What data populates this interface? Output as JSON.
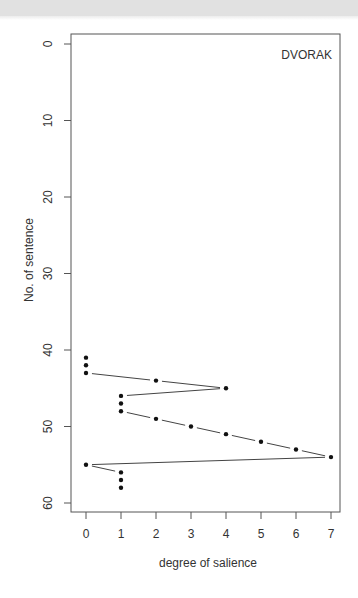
{
  "chart_data": {
    "type": "line",
    "title": "DVORAK",
    "xlabel": "degree of salience",
    "ylabel": "No. of sentence",
    "xlim": [
      0,
      7
    ],
    "ylim": [
      60,
      0
    ],
    "y_inverted": true,
    "grid": false,
    "legend": null,
    "x_ticks": [
      0,
      1,
      2,
      3,
      4,
      5,
      6,
      7
    ],
    "y_ticks": [
      0,
      10,
      20,
      30,
      40,
      50,
      60
    ],
    "style": "points connected by lines with gaps (type b)",
    "points": [
      {
        "sentence": 41,
        "salience": 0
      },
      {
        "sentence": 42,
        "salience": 0
      },
      {
        "sentence": 43,
        "salience": 0
      },
      {
        "sentence": 44,
        "salience": 2
      },
      {
        "sentence": 45,
        "salience": 4
      },
      {
        "sentence": 46,
        "salience": 1
      },
      {
        "sentence": 47,
        "salience": 1
      },
      {
        "sentence": 48,
        "salience": 1
      },
      {
        "sentence": 49,
        "salience": 2
      },
      {
        "sentence": 50,
        "salience": 3
      },
      {
        "sentence": 51,
        "salience": 4
      },
      {
        "sentence": 52,
        "salience": 5
      },
      {
        "sentence": 53,
        "salience": 6
      },
      {
        "sentence": 54,
        "salience": 7
      },
      {
        "sentence": 55,
        "salience": 0
      },
      {
        "sentence": 56,
        "salience": 1
      },
      {
        "sentence": 57,
        "salience": 1
      },
      {
        "sentence": 58,
        "salience": 1
      }
    ]
  },
  "labels": {
    "title": "DVORAK",
    "xlabel": "degree of salience",
    "ylabel": "No. of sentence"
  }
}
